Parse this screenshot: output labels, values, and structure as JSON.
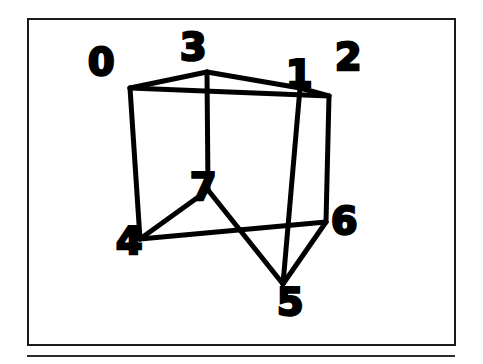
{
  "figure": {
    "kind": "wireframe-cube-diagram",
    "caption": "",
    "background_color": "#ffffff",
    "ink_color": "#000000",
    "frame": {
      "border_color": "#1a1a1a",
      "border_width_px": 2,
      "x": 27,
      "y": 18,
      "width": 429,
      "height": 328
    },
    "rule": {
      "color": "#2b2b2b",
      "x": 27,
      "y": 355,
      "width": 428,
      "height": 2
    }
  },
  "chart_data": {
    "type": "diagram",
    "title": "",
    "subtitle": "",
    "xlabel": "",
    "ylabel": "",
    "stroke_color": "#000000",
    "stroke_width": 5,
    "vertices": [
      {
        "id": "0",
        "label": "0",
        "x": 130,
        "y": 88,
        "label_x": 88,
        "label_y": 43,
        "role": "top-back-left"
      },
      {
        "id": "1",
        "label": "1",
        "x": 300,
        "y": 88,
        "label_x": 286,
        "label_y": 55,
        "role": "top-back-right"
      },
      {
        "id": "2",
        "label": "2",
        "x": 329,
        "y": 96,
        "label_x": 335,
        "label_y": 38,
        "role": "top-front-right"
      },
      {
        "id": "3",
        "label": "3",
        "x": 207,
        "y": 72,
        "label_x": 180,
        "label_y": 28,
        "role": "top-front-left"
      },
      {
        "id": "4",
        "label": "4",
        "x": 140,
        "y": 239,
        "label_x": 116,
        "label_y": 222,
        "role": "bottom-back-left"
      },
      {
        "id": "5",
        "label": "5",
        "x": 283,
        "y": 284,
        "label_x": 277,
        "label_y": 283,
        "role": "bottom-front-right"
      },
      {
        "id": "6",
        "label": "6",
        "x": 326,
        "y": 222,
        "label_x": 331,
        "label_y": 202,
        "role": "bottom-back-right"
      },
      {
        "id": "7",
        "label": "7",
        "x": 208,
        "y": 190,
        "label_x": 190,
        "label_y": 168,
        "role": "bottom-front-left-hidden"
      }
    ],
    "edges": [
      {
        "from": "0",
        "to": "3"
      },
      {
        "from": "3",
        "to": "1"
      },
      {
        "from": "1",
        "to": "2"
      },
      {
        "from": "2",
        "to": "0"
      },
      {
        "from": "0",
        "to": "4"
      },
      {
        "from": "3",
        "to": "7"
      },
      {
        "from": "1",
        "to": "5"
      },
      {
        "from": "2",
        "to": "6"
      },
      {
        "from": "4",
        "to": "7"
      },
      {
        "from": "7",
        "to": "5"
      },
      {
        "from": "5",
        "to": "6"
      },
      {
        "from": "6",
        "to": "4"
      }
    ],
    "legend": [],
    "annotations": []
  }
}
